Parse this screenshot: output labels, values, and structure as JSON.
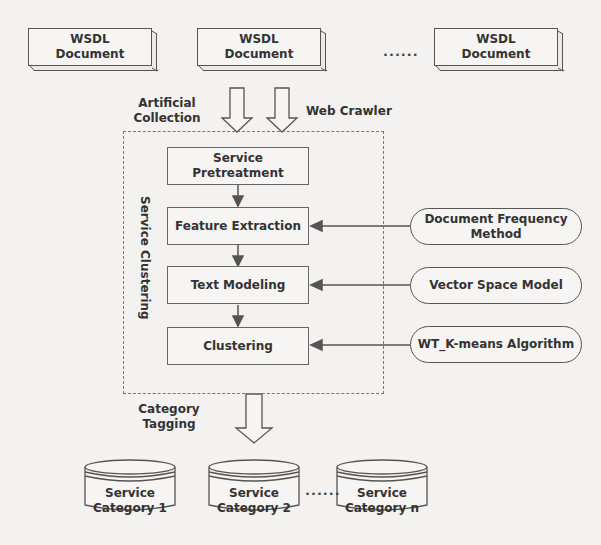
{
  "sources": {
    "documents": [
      {
        "line1": "WSDL",
        "line2": "Document"
      },
      {
        "line1": "WSDL",
        "line2": "Document"
      },
      {
        "line1": "WSDL",
        "line2": "Document"
      }
    ],
    "ellipsis": "......"
  },
  "inputs": {
    "artificial_line1": "Artificial",
    "artificial_line2": "Collection",
    "crawler": "Web Crawler"
  },
  "clustering": {
    "group_label": "Service Clustering",
    "steps": [
      {
        "line1": "Service",
        "line2": "Pretreatment"
      },
      {
        "line1": "Feature Extraction"
      },
      {
        "line1": "Text Modeling"
      },
      {
        "line1": "Clustering"
      }
    ]
  },
  "methods": [
    {
      "line1": "Document Frequency",
      "line2": "Method"
    },
    {
      "line1": "Vector Space Model"
    },
    {
      "line1": "WT_K-means Algorithm"
    }
  ],
  "tagging": {
    "line1": "Category",
    "line2": "Tagging"
  },
  "outputs": {
    "categories": [
      {
        "line1": "Service",
        "line2": "Category 1"
      },
      {
        "line1": "Service",
        "line2": "Category 2"
      },
      {
        "line1": "Service",
        "line2": "Category n"
      }
    ],
    "ellipsis": "......"
  }
}
